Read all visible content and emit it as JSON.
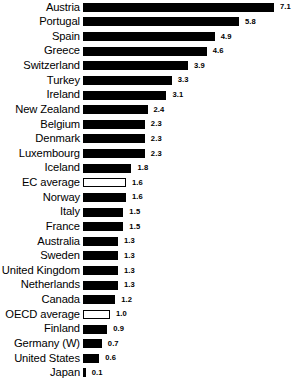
{
  "chart_data": {
    "type": "bar",
    "orientation": "horizontal",
    "title": "",
    "subtitle": "",
    "xlabel": "",
    "ylabel": "",
    "grid": false,
    "legend": false,
    "axis_visible": false,
    "xlim": [
      0,
      7.1
    ],
    "value_labels_shown": true,
    "colors": {
      "bar_fill": "#000000",
      "average_bar_fill": "#ffffff",
      "average_bar_stroke": "#000000",
      "text": "#000000",
      "background": "#ffffff"
    },
    "categories": [
      "Austria",
      "Portugal",
      "Spain",
      "Greece",
      "Switzerland",
      "Turkey",
      "Ireland",
      "New Zealand",
      "Belgium",
      "Denmark",
      "Luxembourg",
      "Iceland",
      "EC average",
      "Norway",
      "Italy",
      "France",
      "Australia",
      "Sweden",
      "United Kingdom",
      "Netherlands",
      "Canada",
      "OECD average",
      "Finland",
      "Germany (W)",
      "United States",
      "Japan"
    ],
    "values": [
      7.1,
      5.8,
      4.9,
      4.6,
      3.9,
      3.3,
      3.1,
      2.4,
      2.3,
      2.3,
      2.3,
      1.8,
      1.6,
      1.6,
      1.5,
      1.5,
      1.3,
      1.3,
      1.3,
      1.3,
      1.2,
      1.0,
      0.9,
      0.7,
      0.6,
      0.1
    ],
    "rows": [
      {
        "label": "Austria",
        "value": 7.1,
        "value_text": "7.1",
        "hollow": false
      },
      {
        "label": "Portugal",
        "value": 5.8,
        "value_text": "5.8",
        "hollow": false
      },
      {
        "label": "Spain",
        "value": 4.9,
        "value_text": "4.9",
        "hollow": false
      },
      {
        "label": "Greece",
        "value": 4.6,
        "value_text": "4.6",
        "hollow": false
      },
      {
        "label": "Switzerland",
        "value": 3.9,
        "value_text": "3.9",
        "hollow": false
      },
      {
        "label": "Turkey",
        "value": 3.3,
        "value_text": "3.3",
        "hollow": false
      },
      {
        "label": "Ireland",
        "value": 3.1,
        "value_text": "3.1",
        "hollow": false
      },
      {
        "label": "New Zealand",
        "value": 2.4,
        "value_text": "2.4",
        "hollow": false
      },
      {
        "label": "Belgium",
        "value": 2.3,
        "value_text": "2.3",
        "hollow": false
      },
      {
        "label": "Denmark",
        "value": 2.3,
        "value_text": "2.3",
        "hollow": false
      },
      {
        "label": "Luxembourg",
        "value": 2.3,
        "value_text": "2.3",
        "hollow": false
      },
      {
        "label": "Iceland",
        "value": 1.8,
        "value_text": "1.8",
        "hollow": false
      },
      {
        "label": "EC average",
        "value": 1.6,
        "value_text": "1.6",
        "hollow": true
      },
      {
        "label": "Norway",
        "value": 1.6,
        "value_text": "1.6",
        "hollow": false
      },
      {
        "label": "Italy",
        "value": 1.5,
        "value_text": "1.5",
        "hollow": false
      },
      {
        "label": "France",
        "value": 1.5,
        "value_text": "1.5",
        "hollow": false
      },
      {
        "label": "Australia",
        "value": 1.3,
        "value_text": "1.3",
        "hollow": false
      },
      {
        "label": "Sweden",
        "value": 1.3,
        "value_text": "1.3",
        "hollow": false
      },
      {
        "label": "United Kingdom",
        "value": 1.3,
        "value_text": "1.3",
        "hollow": false
      },
      {
        "label": "Netherlands",
        "value": 1.3,
        "value_text": "1.3",
        "hollow": false
      },
      {
        "label": "Canada",
        "value": 1.2,
        "value_text": "1.2",
        "hollow": false
      },
      {
        "label": "OECD average",
        "value": 1.0,
        "value_text": "1.0",
        "hollow": true
      },
      {
        "label": "Finland",
        "value": 0.9,
        "value_text": "0.9",
        "hollow": false
      },
      {
        "label": "Germany (W)",
        "value": 0.7,
        "value_text": "0.7",
        "hollow": false
      },
      {
        "label": "United States",
        "value": 0.6,
        "value_text": "0.6",
        "hollow": false
      },
      {
        "label": "Japan",
        "value": 0.1,
        "value_text": "0.1",
        "hollow": false
      }
    ]
  },
  "layout": {
    "px_per_unit": 26.9,
    "bar_origin_x": 86
  }
}
